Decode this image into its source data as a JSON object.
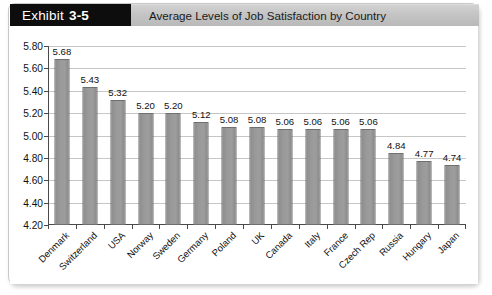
{
  "exhibit": {
    "tag_word": "Exhibit",
    "tag_number": "3-5",
    "title": "Average Levels of Job Satisfaction by Country"
  },
  "chart_data": {
    "type": "bar",
    "title": "Average Levels of Job Satisfaction by Country",
    "xlabel": "",
    "ylabel": "",
    "ylim": [
      4.2,
      5.8
    ],
    "ytick_step": 0.2,
    "grid": true,
    "legend": "none",
    "label_rotation_deg": -45,
    "yticks": [
      "5.80",
      "5.60",
      "5.40",
      "5.20",
      "5.00",
      "4.80",
      "4.60",
      "4.40",
      "4.20"
    ],
    "categories": [
      "Denmark",
      "Switzerland",
      "USA",
      "Norway",
      "Sweden",
      "Germany",
      "Poland",
      "UK",
      "Canada",
      "Italy",
      "France",
      "Czech Rep",
      "Russia",
      "Hungary",
      "Japan"
    ],
    "values": [
      5.68,
      5.43,
      5.32,
      5.2,
      5.2,
      5.12,
      5.08,
      5.08,
      5.06,
      5.06,
      5.06,
      5.06,
      4.84,
      4.77,
      4.74
    ],
    "value_labels": [
      "5.68",
      "5.43",
      "5.32",
      "5.20",
      "5.20",
      "5.12",
      "5.08",
      "5.08",
      "5.06",
      "5.06",
      "5.06",
      "5.06",
      "4.84",
      "4.77",
      "4.74"
    ],
    "bar_color": "#9a9a9a",
    "bar_border_color": "#6f6f6f",
    "gridline_color": "#c6c6c6",
    "axis_color": "#4a4a4a"
  },
  "colors": {
    "tag_background": "#0d0d0d",
    "tag_text": "#ffffff",
    "title_band": "#c4c4c4",
    "card_background": "#ffffff",
    "card_border": "#c9c9c9"
  }
}
